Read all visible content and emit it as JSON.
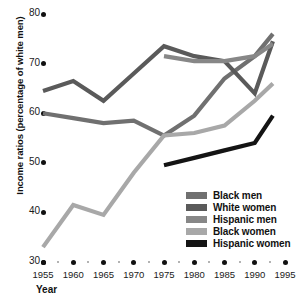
{
  "chart_data": {
    "type": "line",
    "title": "",
    "xlabel": "Year",
    "ylabel": "Income ratios (percentage of white men)",
    "xlim": [
      1955,
      1995
    ],
    "ylim": [
      30,
      80
    ],
    "xticks": [
      1955,
      1960,
      1965,
      1970,
      1975,
      1980,
      1985,
      1990,
      1995
    ],
    "yticks": [
      30,
      40,
      50,
      60,
      70,
      80
    ],
    "grid": false,
    "legend_position": "inside bottom-right",
    "series": [
      {
        "name": "Black men",
        "color": "#707070",
        "x": [
          1955,
          1960,
          1965,
          1970,
          1975,
          1980,
          1985,
          1990,
          1993
        ],
        "values": [
          60.0,
          59.0,
          58.0,
          58.5,
          55.5,
          59.5,
          67.0,
          71.5,
          76.0
        ]
      },
      {
        "name": "White women",
        "color": "#5a5a5a",
        "x": [
          1955,
          1960,
          1965,
          1970,
          1975,
          1980,
          1985,
          1990,
          1993
        ],
        "values": [
          64.5,
          66.5,
          62.5,
          68.0,
          73.5,
          71.5,
          70.5,
          64.0,
          74.5
        ]
      },
      {
        "name": "Hispanic men",
        "color": "#878787",
        "x": [
          1975,
          1980,
          1985,
          1990,
          1993
        ],
        "values": [
          71.5,
          70.5,
          70.5,
          71.5,
          74.0
        ]
      },
      {
        "name": "Black women",
        "color": "#a8a8a8",
        "x": [
          1955,
          1960,
          1965,
          1970,
          1975,
          1980,
          1985,
          1990,
          1993
        ],
        "values": [
          33.0,
          41.5,
          39.5,
          48.0,
          55.5,
          56.0,
          57.5,
          62.5,
          66.0
        ]
      },
      {
        "name": "Hispanic women",
        "color": "#141414",
        "x": [
          1975,
          1980,
          1985,
          1990,
          1993
        ],
        "values": [
          49.5,
          51.0,
          52.5,
          54.0,
          59.5
        ]
      }
    ]
  },
  "legend": {
    "items": [
      {
        "label": "Black men",
        "color": "#707070"
      },
      {
        "label": "White women",
        "color": "#5a5a5a"
      },
      {
        "label": "Hispanic men",
        "color": "#878787"
      },
      {
        "label": "Black women",
        "color": "#a8a8a8"
      },
      {
        "label": "Hispanic women",
        "color": "#141414"
      }
    ]
  }
}
